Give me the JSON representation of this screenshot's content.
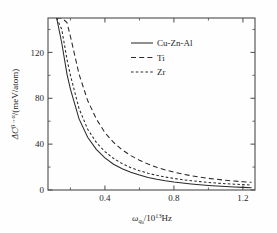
{
  "figure": {
    "background_color": "#fefefe",
    "axis_color": "#4a4a4a",
    "curve_color": "#2a2a2a"
  },
  "axes": {
    "x": {
      "title_main": "/10",
      "title_symbol": "ω",
      "title_sub": "q",
      "title_sub2": "0",
      "title_exp": "13",
      "title_unit": "Hz",
      "title_full": "ωq0/10¹³Hz",
      "tick_labels": [
        "0.4",
        "0.8",
        "1.2"
      ],
      "tick_values": [
        0.4,
        0.8,
        1.2
      ],
      "minor_tick_values": [
        0.2,
        0.6,
        1.0
      ],
      "range": [
        0.07,
        1.27
      ]
    },
    "y": {
      "title_symbol": "ΔC",
      "title_exp": "β→α",
      "title_unit": "/(meV/atom)",
      "title_full": "ΔCβ→α/(meV/atom)",
      "tick_labels": [
        "0",
        "40",
        "80",
        "120"
      ],
      "tick_values": [
        0,
        40,
        80,
        120
      ],
      "minor_tick_values": [
        20,
        60,
        100,
        140
      ],
      "range": [
        0,
        150
      ]
    }
  },
  "legend": {
    "position": "upper-center-right",
    "entries": [
      {
        "label": "Cu-Zn-Al",
        "style": "solid"
      },
      {
        "label": "Ti",
        "style": "dashed"
      },
      {
        "label": "Zr",
        "style": "dotted"
      }
    ]
  },
  "chart_data": {
    "type": "line",
    "title": "",
    "xlabel": "ωq0/10¹³Hz",
    "ylabel": "ΔCβ→α/(meV/atom)",
    "xlim": [
      0.07,
      1.27
    ],
    "ylim": [
      0,
      150
    ],
    "grid": false,
    "legend_position": "upper right",
    "x": [
      0.12,
      0.15,
      0.18,
      0.2,
      0.25,
      0.3,
      0.35,
      0.4,
      0.45,
      0.5,
      0.55,
      0.6,
      0.65,
      0.7,
      0.75,
      0.8,
      0.85,
      0.9,
      0.95,
      1.0,
      1.05,
      1.1,
      1.15,
      1.2,
      1.25
    ],
    "series": [
      {
        "name": "Cu-Zn-Al",
        "style": "solid",
        "values": [
          150,
          128,
          101,
          88,
          62,
          46,
          35.5,
          28.0,
          22.5,
          18.5,
          15.4,
          13.0,
          11.0,
          9.4,
          8.1,
          7.0,
          6.1,
          5.3,
          4.6,
          4.0,
          3.5,
          3.1,
          2.7,
          2.3,
          2.0
        ]
      },
      {
        "name": "Ti",
        "style": "dashed",
        "values": [
          150,
          150,
          146,
          134,
          101,
          78,
          62,
          50,
          41.5,
          35.0,
          30.0,
          26.0,
          22.6,
          19.8,
          17.5,
          15.5,
          13.9,
          12.5,
          11.3,
          10.2,
          9.3,
          8.5,
          7.8,
          7.2,
          6.7
        ]
      },
      {
        "name": "Zr",
        "style": "dotted",
        "values": [
          150,
          140,
          114,
          100,
          71,
          53,
          41.5,
          33.5,
          27.5,
          23.0,
          19.5,
          16.8,
          14.6,
          12.8,
          11.3,
          10.1,
          9.0,
          8.1,
          7.3,
          6.6,
          6.0,
          5.5,
          5.1,
          4.7,
          4.3
        ]
      }
    ]
  }
}
